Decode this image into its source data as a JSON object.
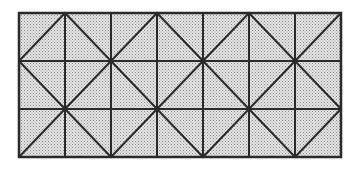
{
  "diagram": {
    "grid": {
      "x0": 19,
      "y0": 13,
      "cols": 7,
      "rows": 3,
      "cell_w": 46,
      "cell_h": 48
    },
    "zigzags": [
      [
        [
          19,
          61
        ],
        [
          65,
          13
        ],
        [
          111,
          61
        ],
        [
          157,
          13
        ],
        [
          203,
          61
        ],
        [
          249,
          13
        ],
        [
          295,
          61
        ],
        [
          341,
          13
        ]
      ],
      [
        [
          19,
          61
        ],
        [
          65,
          109
        ],
        [
          111,
          61
        ],
        [
          157,
          109
        ],
        [
          203,
          61
        ],
        [
          249,
          109
        ],
        [
          295,
          61
        ],
        [
          341,
          109
        ]
      ],
      [
        [
          19,
          157
        ],
        [
          65,
          109
        ],
        [
          111,
          157
        ],
        [
          157,
          109
        ],
        [
          203,
          157
        ],
        [
          249,
          109
        ],
        [
          295,
          157
        ],
        [
          341,
          109
        ]
      ]
    ],
    "colors": {
      "fill": "#dcdcdc",
      "dot": "#8a8a8a",
      "line": "#2a2a2a",
      "background": "#ffffff"
    }
  }
}
